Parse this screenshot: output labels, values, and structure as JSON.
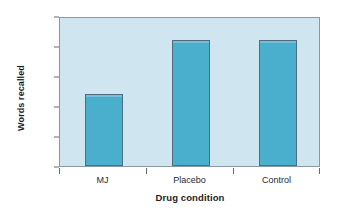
{
  "chart_data": {
    "type": "bar",
    "title": "",
    "categories": [
      "MJ",
      "Placebo",
      "Control"
    ],
    "values": [
      12,
      21,
      21
    ],
    "xlabel": "Drug condition",
    "ylabel": "Words recalled",
    "ylim": [
      0,
      25
    ],
    "yticks": [
      0,
      5,
      10,
      15,
      20,
      25
    ],
    "ytick_labels": [
      "0",
      "5",
      "10",
      "15",
      "20",
      "25"
    ],
    "grid": false,
    "legend": null,
    "colors": {
      "bar_fill": "#4aaecd",
      "bar_border": "#516c80",
      "plot_background": "#cfe5f0",
      "frame": "#8a98a3",
      "canvas": "#ffffff",
      "text": "#1d1d1f"
    }
  }
}
